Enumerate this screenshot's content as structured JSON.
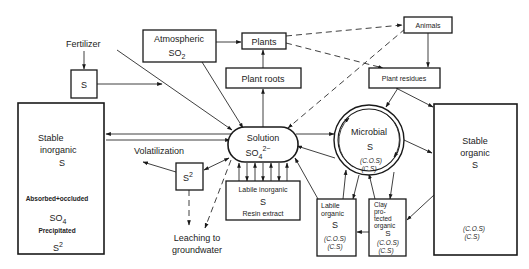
{
  "nodes": {
    "fertilizer": {
      "label": "Fertilizer"
    },
    "fert_s": {
      "label": "S"
    },
    "atmospheric": {
      "line1": "Atmospheric",
      "line2": "SO",
      "sub": "2"
    },
    "plants": {
      "label": "Plants"
    },
    "plant_roots": {
      "label": "Plant roots"
    },
    "animals": {
      "label": "Animals"
    },
    "plant_residues": {
      "label": "Plant residues"
    },
    "stable_inorganic": {
      "line1": "Stable",
      "line2": "inorganic",
      "line3": "S",
      "absorbed": "Absorbed+occluded",
      "so4": "SO",
      "so4_sub": "4",
      "precipitated": "Precipitated",
      "s2": "S",
      "s2_sup": "2"
    },
    "volatilization": {
      "label": "Volatilization"
    },
    "s2_box": {
      "label": "S",
      "sup": "2"
    },
    "solution": {
      "line1": "Solution",
      "line2": "SO",
      "sub": "4",
      "sup": "2−"
    },
    "labile_inorganic": {
      "line1": "Labile inorganic",
      "line2": "S",
      "line3": "Resin extract"
    },
    "leaching": {
      "line1": "Leaching to",
      "line2": "groundwater"
    },
    "microbial": {
      "line1": "Microbial",
      "line2": "S",
      "line3": "(C.O.S)",
      "line4": "(C.S)"
    },
    "labile_organic": {
      "line1": "Labile",
      "line2": "organic",
      "line3": "S",
      "line4": "(C.O.S)",
      "line5": "(C.S)"
    },
    "clay_protected": {
      "line1": "Clay",
      "line2": "pro-",
      "line3": "tected",
      "line4": "organic",
      "line5": "S",
      "line6": "(C.O.S)",
      "line7": "(C.S)"
    },
    "stable_organic": {
      "line1": "Stable",
      "line2": "organic",
      "line3": "S",
      "line4": "(C.O.S)",
      "line5": "(C.S)"
    }
  }
}
